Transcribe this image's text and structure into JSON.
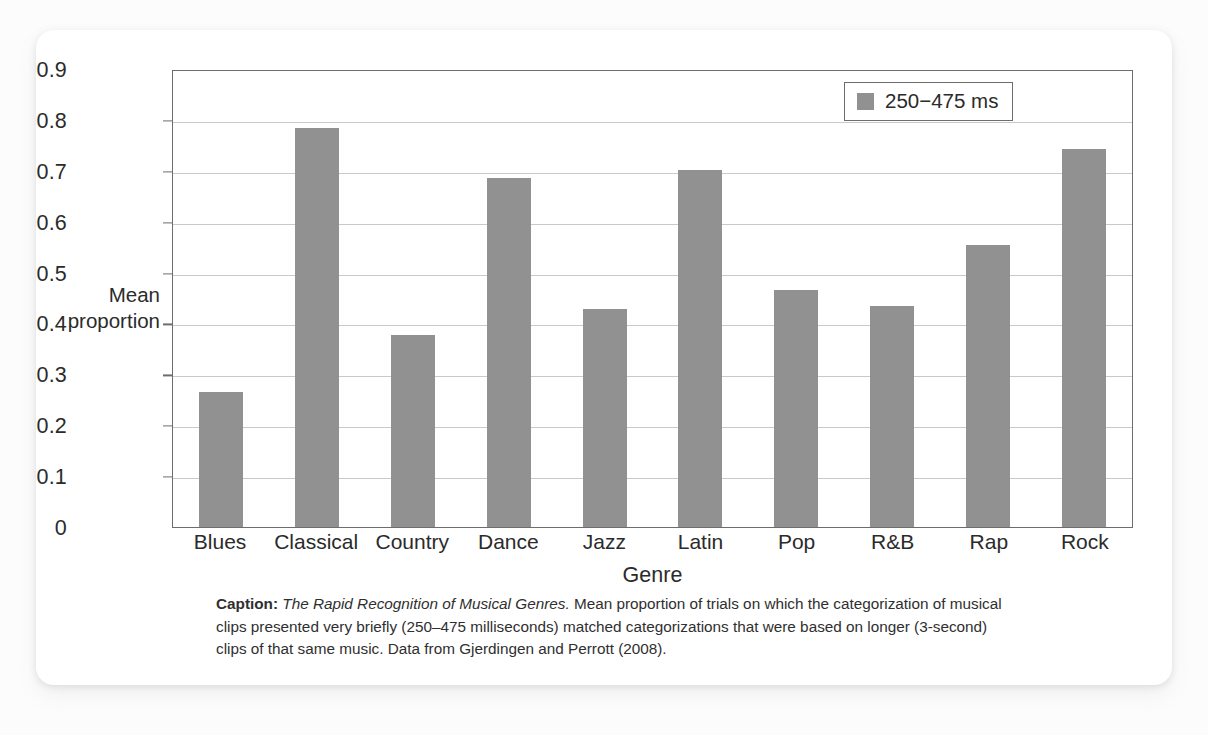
{
  "chart_data": {
    "type": "bar",
    "title": "",
    "xlabel": "Genre",
    "ylabel": "Mean proportion",
    "categories": [
      "Blues",
      "Classical",
      "Country",
      "Dance",
      "Jazz",
      "Latin",
      "Pop",
      "R&B",
      "Rap",
      "Rock"
    ],
    "values": [
      0.265,
      0.785,
      0.378,
      0.685,
      0.428,
      0.702,
      0.465,
      0.435,
      0.555,
      0.742
    ],
    "series": [
      {
        "name": "250−475 ms",
        "values": [
          0.265,
          0.785,
          0.378,
          0.685,
          0.428,
          0.702,
          0.465,
          0.435,
          0.555,
          0.742
        ]
      }
    ],
    "ylim": [
      0,
      0.9
    ],
    "ytick_values": [
      0,
      0.1,
      0.2,
      0.3,
      0.4,
      0.5,
      0.6,
      0.7,
      0.8,
      0.9
    ],
    "ytick_labels": [
      "0",
      "0.1",
      "0.2",
      "0.3",
      "0.4",
      "0.5",
      "0.6",
      "0.7",
      "0.8",
      "0.9"
    ],
    "grid": "horizontal",
    "legend_position": "top-right",
    "bar_color": "#919191"
  },
  "axes": {
    "y_title_line1": "Mean",
    "y_title_line2": "proportion",
    "x_title": "Genre"
  },
  "legend": {
    "entries": [
      {
        "label": "250−475 ms",
        "color": "#919191"
      }
    ]
  },
  "caption": {
    "label": "Caption:",
    "title": "The Rapid Recognition of Musical Genres.",
    "body": " Mean proportion of trials on which the categorization of musical clips presented very briefly (250–475 milliseconds) matched categorizations that were based on longer (3-second) clips of that same music. Data from Gjerdingen and Perrott (2008)."
  }
}
